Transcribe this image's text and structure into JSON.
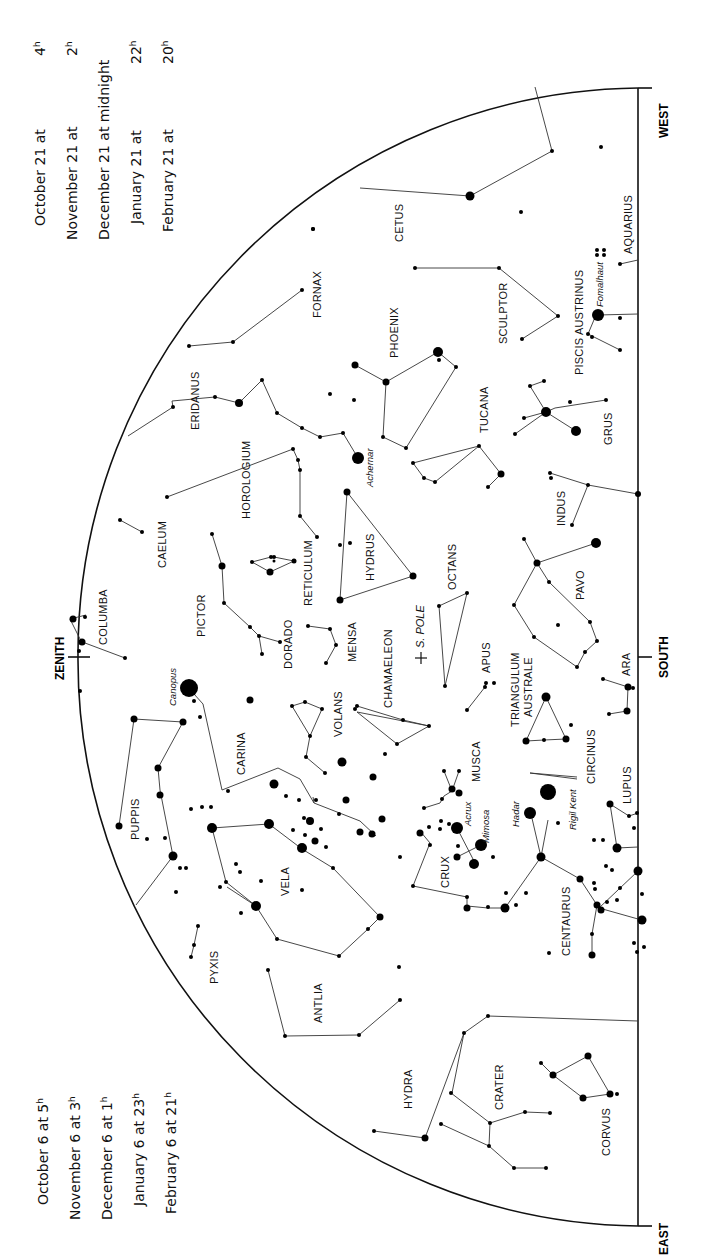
{
  "time_tables": {
    "top_right": {
      "rows": [
        {
          "date": "October 21 at",
          "time": "4",
          "unit": "h"
        },
        {
          "date": "November 21 at",
          "time": "2",
          "unit": "h"
        },
        {
          "date": "December 21 at midnight",
          "time": "",
          "unit": ""
        },
        {
          "date": "January 21 at",
          "time": "22",
          "unit": "h"
        },
        {
          "date": "February 21 at",
          "time": "20",
          "unit": "h"
        }
      ]
    },
    "bottom_left": {
      "rows": [
        {
          "date": "October 6 at",
          "time": "5",
          "unit": "h"
        },
        {
          "date": "November 6 at",
          "time": "3",
          "unit": "h"
        },
        {
          "date": "December 6 at",
          "time": "1",
          "unit": "h"
        },
        {
          "date": "January 6 at",
          "time": "23",
          "unit": "h"
        },
        {
          "date": "February 6 at",
          "time": "21",
          "unit": "h"
        }
      ]
    }
  },
  "directions": {
    "zenith": "ZENITH",
    "south": "SOUTH",
    "west": "WEST",
    "east": "EAST",
    "south_pole": "S. POLE"
  },
  "constellations": {
    "cetus": "CETUS",
    "aquarius": "AQUARIUS",
    "fornax": "FORNAX",
    "sculptor": "SCULPTOR",
    "piscis_austrinus": "PISCIS AUSTRINUS",
    "phoenix": "PHOENIX",
    "eridanus": "ERIDANUS",
    "grus": "GRUS",
    "tucana": "TUCANA",
    "horologium": "HOROLOGIUM",
    "indus": "INDUS",
    "caelum": "CAELUM",
    "hydrus": "HYDRUS",
    "reticulum": "RETICULUM",
    "octans": "OCTANS",
    "columba": "COLUMBA",
    "pictor": "PICTOR",
    "dorado": "DORADO",
    "mensa": "MENSA",
    "pavo": "PAVO",
    "chameleon": "CHAMAELEON",
    "apus": "APUS",
    "triangulum_australe_1": "TRIANGULUM",
    "triangulum_australe_2": "AUSTRALE",
    "ara": "ARA",
    "carina": "CARINA",
    "volans": "VOLANS",
    "musca": "MUSCA",
    "circinus": "CIRCINUS",
    "lupus": "LUPUS",
    "puppis": "PUPPIS",
    "vela": "VELA",
    "crux": "CRUX",
    "centaurus": "CENTAURUS",
    "pyxis": "PYXIS",
    "antlia": "ANTLIA",
    "hydra": "HYDRA",
    "crater": "CRATER",
    "corvus": "CORVUS"
  },
  "stars": {
    "fomalhaut": "Fomalhaut",
    "achernar": "Achernar",
    "canopus": "Canopus",
    "acrux": "Acrux",
    "mimosa": "Mimosa",
    "hadar": "Hadar",
    "rigil_kent": "Rigil Kent"
  }
}
